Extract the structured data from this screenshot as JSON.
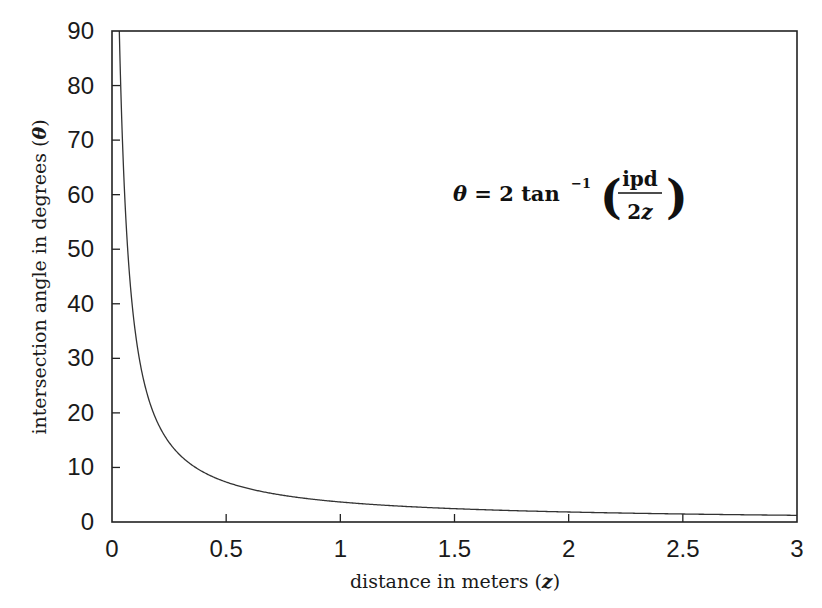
{
  "chart_data": {
    "type": "line",
    "title": "",
    "xlabel": "distance in meters (z)",
    "ylabel": "intersection angle in degrees (θ)",
    "xlim": [
      0,
      3
    ],
    "ylim": [
      0,
      90
    ],
    "grid": false,
    "legend": null,
    "x_ticks": [
      "0",
      "0.5",
      "1",
      "1.5",
      "2",
      "2.5",
      "3"
    ],
    "x_tick_values": [
      0,
      0.5,
      1,
      1.5,
      2,
      2.5,
      3
    ],
    "y_ticks": [
      "0",
      "10",
      "20",
      "30",
      "40",
      "50",
      "60",
      "70",
      "80",
      "90"
    ],
    "y_tick_values": [
      0,
      10,
      20,
      30,
      40,
      50,
      60,
      70,
      80,
      90
    ],
    "annotation": {
      "lhs": "θ = 2 tan",
      "exponent": "−1",
      "numerator": "ipd",
      "denominator": "2z",
      "text": "θ = 2 tan⁻¹ (ipd / 2z)"
    },
    "series": [
      {
        "name": "θ(z)",
        "formula": "2*atan(ipd/(2z))",
        "ipd": 0.064,
        "x": [
          0.02,
          0.05,
          0.1,
          0.15,
          0.2,
          0.3,
          0.5,
          0.75,
          1,
          1.5,
          2,
          2.5,
          3
        ],
        "values": [
          116.0,
          65.2,
          35.5,
          24.1,
          18.2,
          12.2,
          7.3,
          4.9,
          3.7,
          2.4,
          1.8,
          1.5,
          1.2
        ]
      }
    ],
    "color": "#333333"
  }
}
